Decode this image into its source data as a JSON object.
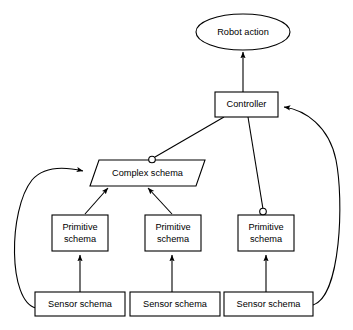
{
  "diagram": {
    "background_color": "#ffffff",
    "line_color": "#000000",
    "nodes": {
      "robot_action": {
        "label": "Robot action",
        "shape": "ellipse"
      },
      "controller": {
        "label": "Controller",
        "shape": "rectangle"
      },
      "complex_schema": {
        "label": "Complex schema",
        "shape": "parallelogram"
      },
      "primitive_schema_1": {
        "label_line1": "Primitive",
        "label_line2": "schema",
        "shape": "rectangle"
      },
      "primitive_schema_2": {
        "label_line1": "Primitive",
        "label_line2": "schema",
        "shape": "rectangle"
      },
      "primitive_schema_3": {
        "label_line1": "Primitive",
        "label_line2": "schema",
        "shape": "rectangle"
      },
      "sensor_schema_1": {
        "label": "Sensor schema",
        "shape": "rectangle"
      },
      "sensor_schema_2": {
        "label": "Sensor schema",
        "shape": "rectangle"
      },
      "sensor_schema_3": {
        "label": "Sensor schema",
        "shape": "rectangle"
      }
    }
  }
}
